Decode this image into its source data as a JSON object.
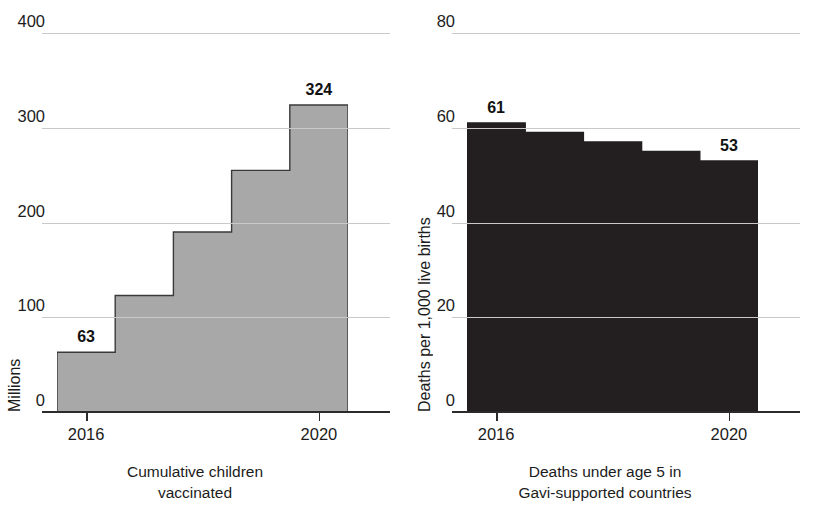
{
  "chart_data": [
    {
      "type": "area",
      "subtype": "step-area",
      "panel": "left",
      "title": "",
      "xlabel": "Cumulative children vaccinated",
      "xlabel_lines": [
        "Cumulative children",
        "vaccinated"
      ],
      "ylabel": "Millions",
      "x": [
        2016,
        2017,
        2018,
        2019,
        2020
      ],
      "categories": [
        "2016",
        "2017",
        "2018",
        "2019",
        "2020"
      ],
      "values": [
        63,
        123,
        190,
        255,
        324
      ],
      "ylim": [
        0,
        400
      ],
      "yticks": [
        0,
        100,
        200,
        300,
        400
      ],
      "ytick_labels": [
        "0",
        "100",
        "200",
        "300",
        "400"
      ],
      "xticks": [
        2016,
        2020
      ],
      "xtick_labels": [
        "2016",
        "2020"
      ],
      "grid": true,
      "fill_color": "#a8a8a8",
      "edge_color": "#3a3a3a",
      "data_labels": [
        {
          "category": "2016",
          "value": 63,
          "text": "63"
        },
        {
          "category": "2020",
          "value": 324,
          "text": "324"
        }
      ]
    },
    {
      "type": "area",
      "subtype": "step-area",
      "panel": "right",
      "title": "",
      "xlabel": "Deaths under age 5 in Gavi-supported countries",
      "xlabel_lines": [
        "Deaths under age 5 in",
        "Gavi-supported countries"
      ],
      "ylabel": "Deaths per 1,000 live births",
      "x": [
        2016,
        2017,
        2018,
        2019,
        2020
      ],
      "categories": [
        "2016",
        "2017",
        "2018",
        "2019",
        "2020"
      ],
      "values": [
        61,
        59,
        57,
        55,
        53
      ],
      "ylim": [
        0,
        80
      ],
      "yticks": [
        0,
        20,
        40,
        60,
        80
      ],
      "ytick_labels": [
        "0",
        "20",
        "40",
        "60",
        "80"
      ],
      "xticks": [
        2016,
        2020
      ],
      "xtick_labels": [
        "2016",
        "2020"
      ],
      "grid": true,
      "fill_color": "#231f20",
      "edge_color": "#231f20",
      "data_labels": [
        {
          "category": "2016",
          "value": 61,
          "text": "61"
        },
        {
          "category": "2020",
          "value": 53,
          "text": "53"
        }
      ]
    }
  ],
  "colors": {
    "gridline": "#c9c9c9",
    "axis": "#2b2b2b",
    "text": "#1c1c1c",
    "left_series": "#a8a8a8",
    "right_series": "#231f20",
    "background": "#ffffff"
  }
}
